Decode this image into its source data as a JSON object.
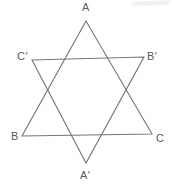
{
  "diagram": {
    "type": "geometry-figure",
    "background_color": "#ffffff",
    "stroke_color": "#757575",
    "label_color": "#5a5a5a",
    "triangle_up_points": "86,21 22,136 152,134",
    "triangle_down_points": "32,60 144,57 86,163",
    "labels": {
      "A": "A",
      "C_prime": "C′",
      "B_prime": "B′",
      "B": "B",
      "C": "C",
      "A_prime": "A′"
    }
  }
}
